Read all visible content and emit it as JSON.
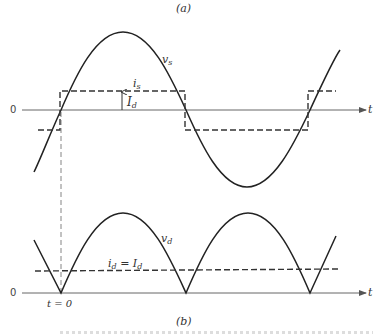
{
  "figure": {
    "panel_a_label": "(a)",
    "panel_b_label": "(b)",
    "panel_a": {
      "axis_zero_label": "0",
      "axis_time_label": "t",
      "vs_label": "v",
      "vs_sub": "s",
      "is_label": "i",
      "is_sub": "s",
      "Id_label": "I",
      "Id_sub": "d",
      "description": "Source voltage v_s (sinusoid) and square-wave source current i_s of amplitude I_d"
    },
    "panel_b": {
      "axis_zero_label": "0",
      "axis_time_label": "t",
      "vd_label": "v",
      "vd_sub": "d",
      "id_label": "i",
      "id_sub": "d",
      "id_eq": " = I",
      "id_eq_sub": "d",
      "t0_label": "t = 0",
      "description": "Rectified output voltage v_d = |v_s| and constant DC current i_d = I_d"
    },
    "colors": {
      "waveform": "#222222",
      "axis": "#555555",
      "dashed": "#333333"
    }
  }
}
